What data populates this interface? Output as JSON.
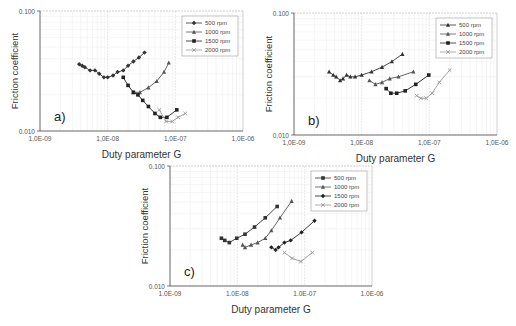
{
  "chart_data": [
    {
      "panel": "a)",
      "type": "line",
      "xscale": "log",
      "yscale": "log",
      "xlabel": "Duty parameter G",
      "ylabel": "Friction coefficient",
      "xlim": [
        1e-09,
        1e-06
      ],
      "ylim": [
        0.01,
        0.1
      ],
      "xticks": [
        "1,0E-09",
        "1,0E-08",
        "1,0E-07",
        "1,0E-06"
      ],
      "yticks": [
        "0.010",
        "0.100"
      ],
      "legend_position": "upper right",
      "series": [
        {
          "name": "500 rpm",
          "marker": "diamond",
          "color": "#333333",
          "x": [
            3.8e-09,
            4.2e-09,
            4.6e-09,
            5.5e-09,
            6.5e-09,
            7.5e-09,
            8.8e-09,
            1e-08,
            1.2e-08,
            1.4e-08,
            1.7e-08,
            2e-08,
            2.4e-08,
            2.9e-08,
            3.5e-08
          ],
          "y": [
            0.036,
            0.035,
            0.034,
            0.032,
            0.032,
            0.03,
            0.028,
            0.028,
            0.029,
            0.031,
            0.032,
            0.035,
            0.038,
            0.041,
            0.045
          ]
        },
        {
          "name": "1000 rpm",
          "marker": "triangle",
          "color": "#555555",
          "x": [
            2.4e-08,
            3e-08,
            4e-08,
            5.3e-08,
            6.8e-08,
            8e-08
          ],
          "y": [
            0.021,
            0.021,
            0.023,
            0.026,
            0.031,
            0.037
          ]
        },
        {
          "name": "1500 rpm",
          "marker": "square",
          "color": "#222222",
          "x": [
            1.7e-08,
            2e-08,
            2.4e-08,
            2.8e-08,
            3.3e-08,
            4e-08,
            5e-08,
            6e-08,
            7.5e-08,
            1.05e-07
          ],
          "y": [
            0.028,
            0.024,
            0.021,
            0.02,
            0.018,
            0.016,
            0.014,
            0.013,
            0.013,
            0.015
          ]
        },
        {
          "name": "2000 rpm",
          "marker": "x",
          "color": "#999999",
          "x": [
            5.8e-08,
            7.3e-08,
            9e-08,
            1.1e-07,
            1.4e-07
          ],
          "y": [
            0.015,
            0.012,
            0.012,
            0.013,
            0.014
          ]
        }
      ]
    },
    {
      "panel": "b)",
      "type": "line",
      "xscale": "log",
      "yscale": "log",
      "xlabel": "Duty parameter G",
      "ylabel": "Friction coefficient",
      "xlim": [
        1e-09,
        1e-06
      ],
      "ylim": [
        0.01,
        0.1
      ],
      "xticks": [
        "1,0E-09",
        "1,0E-08",
        "1,0E-07",
        "1,0E-06"
      ],
      "yticks": [
        "0,010",
        "0.100"
      ],
      "legend_position": "upper right",
      "series": [
        {
          "name": "500 rpm",
          "marker": "triangle",
          "color": "#333333",
          "x": [
            3.3e-09,
            3.8e-09,
            4.2e-09,
            4.8e-09,
            5.3e-09,
            6e-09,
            6.8e-09,
            8e-09,
            1e-08,
            1.4e-08,
            2e-08,
            2.8e-08,
            4e-08
          ],
          "y": [
            0.033,
            0.031,
            0.03,
            0.028,
            0.029,
            0.031,
            0.03,
            0.03,
            0.031,
            0.033,
            0.036,
            0.04,
            0.046
          ]
        },
        {
          "name": "1000 rpm",
          "marker": "triangle",
          "color": "#555555",
          "x": [
            1.3e-08,
            1.6e-08,
            2e-08,
            2.6e-08,
            3.5e-08,
            5.8e-08
          ],
          "y": [
            0.028,
            0.026,
            0.027,
            0.029,
            0.03,
            0.033
          ]
        },
        {
          "name": "1500 rpm",
          "marker": "square",
          "color": "#222222",
          "x": [
            2.3e-08,
            2.7e-08,
            3.3e-08,
            4.4e-08,
            6.3e-08,
            9.8e-08
          ],
          "y": [
            0.024,
            0.022,
            0.022,
            0.023,
            0.026,
            0.031
          ]
        },
        {
          "name": "2000 rpm",
          "marker": "x",
          "color": "#999999",
          "x": [
            6.5e-08,
            7.5e-08,
            9e-08,
            1.1e-07,
            1.4e-07,
            2e-07
          ],
          "y": [
            0.021,
            0.02,
            0.02,
            0.022,
            0.027,
            0.034
          ]
        }
      ]
    },
    {
      "panel": "c)",
      "type": "line",
      "xscale": "log",
      "yscale": "log",
      "xlabel": "Duty parameter G",
      "ylabel": "Friction coefficient",
      "xlim": [
        1e-09,
        1e-06
      ],
      "ylim": [
        0.01,
        0.1
      ],
      "xticks": [
        "1.0E-09",
        "1.0E-08",
        "1.0E-07",
        "1.0E-06"
      ],
      "yticks": [
        "0.010",
        "0.100"
      ],
      "legend_position": "upper right",
      "series": [
        {
          "name": "500 rpm",
          "marker": "square",
          "color": "#333333",
          "x": [
            5.8e-09,
            6.5e-09,
            7.6e-09,
            9.8e-09,
            1.3e-08,
            1.8e-08,
            2.6e-08,
            3.9e-08
          ],
          "y": [
            0.025,
            0.024,
            0.023,
            0.025,
            0.027,
            0.031,
            0.037,
            0.046
          ]
        },
        {
          "name": "1000 rpm",
          "marker": "triangle",
          "color": "#555555",
          "x": [
            1.2e-08,
            1.3e-08,
            1.6e-08,
            2e-08,
            2.6e-08,
            3.2e-08,
            4.3e-08,
            6.4e-08
          ],
          "y": [
            0.022,
            0.021,
            0.022,
            0.023,
            0.025,
            0.029,
            0.037,
            0.051
          ]
        },
        {
          "name": "1500 rpm",
          "marker": "diamond",
          "color": "#222222",
          "x": [
            3.2e-08,
            3.7e-08,
            4.1e-08,
            5e-08,
            6.2e-08,
            9e-08,
            1.4e-07
          ],
          "y": [
            0.021,
            0.02,
            0.021,
            0.023,
            0.024,
            0.028,
            0.035
          ]
        },
        {
          "name": "2000 rpm",
          "marker": "x",
          "color": "#999999",
          "x": [
            5e-08,
            6.5e-08,
            8.8e-08,
            1.3e-07
          ],
          "y": [
            0.019,
            0.017,
            0.016,
            0.019
          ]
        }
      ]
    }
  ],
  "panels": [
    {
      "id": "a",
      "label": "a)",
      "x": 0,
      "y": 0,
      "plot": {
        "left": 40,
        "top": 11,
        "right": 243,
        "bottom": 131
      }
    },
    {
      "id": "b",
      "label": "b)",
      "x": 0,
      "y": 0,
      "plot": {
        "left": 294,
        "top": 13,
        "right": 497,
        "bottom": 135
      }
    },
    {
      "id": "c",
      "label": "c)",
      "x": 0,
      "y": 0,
      "plot": {
        "left": 170,
        "top": 166,
        "right": 372,
        "bottom": 286
      }
    }
  ]
}
